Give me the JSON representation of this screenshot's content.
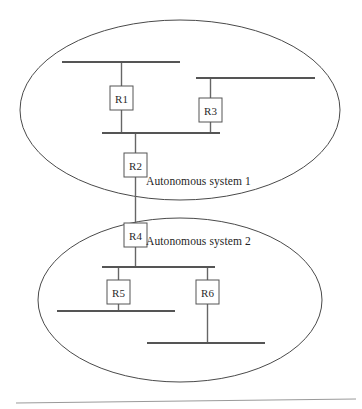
{
  "diagram": {
    "canvas": {
      "width": 362,
      "height": 409,
      "background": "#ffffff"
    },
    "colors": {
      "boundary_stroke": "#4a4a4a",
      "bus_stroke": "#555555",
      "link_stroke": "#666666",
      "box_stroke": "#555555",
      "box_fill": "#ffffff",
      "text": "#1f1f1f",
      "footer_rule": "#9a9a9a"
    },
    "autonomous_systems": [
      {
        "id": "as1",
        "label": "Autonomous system 1",
        "label_x": 146,
        "label_y": 175,
        "ellipse": {
          "cx": 180,
          "cy": 110,
          "rx": 160,
          "ry": 90
        }
      },
      {
        "id": "as2",
        "label": "Autonomous system 2",
        "label_x": 146,
        "label_y": 235,
        "ellipse": {
          "cx": 180,
          "cy": 300,
          "rx": 142,
          "ry": 82
        }
      }
    ],
    "routers": [
      {
        "id": "r1",
        "label": "R1",
        "x": 110,
        "y": 86,
        "w": 23,
        "h": 24,
        "system": "as1"
      },
      {
        "id": "r3",
        "label": "R3",
        "x": 199,
        "y": 98,
        "w": 23,
        "h": 24,
        "system": "as1"
      },
      {
        "id": "r2",
        "label": "R2",
        "x": 124,
        "y": 153,
        "w": 23,
        "h": 24,
        "system": "as1"
      },
      {
        "id": "r4",
        "label": "R4",
        "x": 124,
        "y": 223,
        "w": 23,
        "h": 24,
        "system": "as2"
      },
      {
        "id": "r5",
        "label": "R5",
        "x": 107,
        "y": 280,
        "w": 23,
        "h": 24,
        "system": "as2"
      },
      {
        "id": "r6",
        "label": "R6",
        "x": 196,
        "y": 280,
        "w": 23,
        "h": 24,
        "system": "as2"
      }
    ],
    "bus_segments": [
      {
        "id": "bus-as1-top",
        "x1": 62,
        "y1": 62,
        "x2": 180,
        "y2": 62,
        "system": "as1"
      },
      {
        "id": "bus-as1-r3-upper",
        "x1": 196,
        "y1": 78,
        "x2": 315,
        "y2": 78,
        "system": "as1"
      },
      {
        "id": "bus-as1-middle",
        "x1": 102,
        "y1": 133,
        "x2": 220,
        "y2": 133,
        "system": "as1"
      },
      {
        "id": "bus-as2-upper",
        "x1": 102,
        "y1": 267,
        "x2": 215,
        "y2": 267,
        "system": "as2"
      },
      {
        "id": "bus-as2-r5-lower",
        "x1": 57,
        "y1": 311,
        "x2": 175,
        "y2": 311,
        "system": "as2"
      },
      {
        "id": "bus-as2-r6-lower",
        "x1": 147,
        "y1": 343,
        "x2": 265,
        "y2": 343,
        "system": "as2"
      }
    ],
    "links": [
      {
        "id": "link-r1-top-bus",
        "x1": 121.5,
        "y1": 62,
        "x2": 121.5,
        "y2": 86
      },
      {
        "id": "link-r1-middle-bus",
        "x1": 121.5,
        "y1": 110,
        "x2": 121.5,
        "y2": 133
      },
      {
        "id": "link-r3-upper-bus",
        "x1": 210.5,
        "y1": 78,
        "x2": 210.5,
        "y2": 98
      },
      {
        "id": "link-r3-middle-bus",
        "x1": 210.5,
        "y1": 122,
        "x2": 210.5,
        "y2": 133
      },
      {
        "id": "link-middle-bus-r2",
        "x1": 135.5,
        "y1": 133,
        "x2": 135.5,
        "y2": 153
      },
      {
        "id": "link-r2-r4",
        "x1": 135.5,
        "y1": 177,
        "x2": 135.5,
        "y2": 223
      },
      {
        "id": "link-r4-as2-bus",
        "x1": 135.5,
        "y1": 247,
        "x2": 135.5,
        "y2": 267
      },
      {
        "id": "link-as2-bus-r5",
        "x1": 118.5,
        "y1": 267,
        "x2": 118.5,
        "y2": 280
      },
      {
        "id": "link-r5-lower-bus",
        "x1": 118.5,
        "y1": 304,
        "x2": 118.5,
        "y2": 311
      },
      {
        "id": "link-as2-bus-r6",
        "x1": 207.5,
        "y1": 267,
        "x2": 207.5,
        "y2": 280
      },
      {
        "id": "link-r6-lower-bus",
        "x1": 207.5,
        "y1": 304,
        "x2": 207.5,
        "y2": 343
      }
    ],
    "footer_rule": {
      "x1": 16,
      "y1": 403,
      "x2": 356,
      "y2": 399
    }
  }
}
